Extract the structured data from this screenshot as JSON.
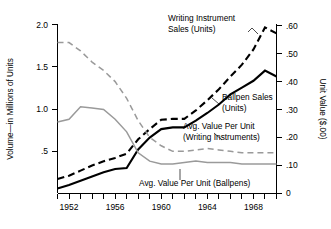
{
  "chart_data": {
    "type": "line",
    "title": "",
    "xlabel": "",
    "ylabel": "Volume—in Millions of Units",
    "y2label": "Unit Value ($.00)",
    "xlim": [
      1951,
      1970
    ],
    "ylim": [
      0,
      2.0
    ],
    "y2lim": [
      0,
      0.6
    ],
    "grid": false,
    "legend_position": "inline-annotations",
    "x_ticks": [
      1951,
      1952,
      1953,
      1954,
      1955,
      1956,
      1957,
      1958,
      1959,
      1960,
      1961,
      1962,
      1963,
      1964,
      1965,
      1966,
      1967,
      1968,
      1969,
      1970
    ],
    "x_tick_labels": [
      "1952",
      "1956",
      "1960",
      "1964",
      "1968"
    ],
    "x_tick_label_values": [
      1952,
      1956,
      1960,
      1964,
      1968
    ],
    "y_ticks": [
      0.5,
      1.0,
      1.5,
      2.0
    ],
    "y_tick_labels": [
      ".5",
      "1.0",
      "1.5",
      "2.0"
    ],
    "y2_ticks": [
      0,
      0.1,
      0.2,
      0.3,
      0.4,
      0.5,
      0.6
    ],
    "y2_tick_labels": [
      "0",
      ".10",
      ".20",
      ".30",
      ".40",
      ".50",
      ".60"
    ],
    "x": [
      1951,
      1952,
      1953,
      1954,
      1955,
      1956,
      1957,
      1958,
      1959,
      1960,
      1961,
      1962,
      1963,
      1964,
      1965,
      1966,
      1967,
      1968,
      1969,
      1970
    ],
    "series": [
      {
        "name": "Writing Instrument Sales (Units)",
        "axis": "left",
        "style": "dashed",
        "color": "#000000",
        "values": [
          0.17,
          0.21,
          0.27,
          0.33,
          0.38,
          0.42,
          0.47,
          0.64,
          0.76,
          0.87,
          0.88,
          0.88,
          0.98,
          1.1,
          1.23,
          1.38,
          1.52,
          1.7,
          1.96,
          1.89
        ]
      },
      {
        "name": "Ballpen Sales (Units)",
        "axis": "left",
        "style": "solid",
        "color": "#000000",
        "values": [
          0.06,
          0.1,
          0.15,
          0.2,
          0.25,
          0.29,
          0.3,
          0.52,
          0.66,
          0.76,
          0.78,
          0.78,
          0.86,
          0.95,
          1.05,
          1.17,
          1.25,
          1.33,
          1.45,
          1.38
        ]
      },
      {
        "name": "Avg. Value Per Unit (Writing Instruments)",
        "axis": "right",
        "style": "dashed",
        "color": "#9a9a9a",
        "values": [
          0.54,
          0.54,
          0.51,
          0.47,
          0.44,
          0.4,
          0.34,
          0.26,
          0.2,
          0.17,
          0.15,
          0.15,
          0.155,
          0.16,
          0.155,
          0.15,
          0.145,
          0.145,
          0.145,
          0.145
        ]
      },
      {
        "name": "Avg. Value Per Unit (Ballpens)",
        "axis": "right",
        "style": "solid",
        "color": "#9a9a9a",
        "values": [
          0.255,
          0.265,
          0.31,
          0.305,
          0.3,
          0.265,
          0.22,
          0.145,
          0.115,
          0.105,
          0.105,
          0.11,
          0.115,
          0.11,
          0.11,
          0.11,
          0.105,
          0.105,
          0.105,
          0.105
        ]
      }
    ],
    "annotations": [
      {
        "id": "writing-instrument-sales",
        "lines": [
          "Writing Instrument",
          "Sales (Units)"
        ],
        "x": 170,
        "y": 24
      },
      {
        "id": "ballpen-sales",
        "lines": [
          "Ballpen Sales",
          "(Units)",
          ""
        ],
        "x": 221,
        "y": 99
      },
      {
        "id": "avg-value-writing-instruments",
        "lines": [
          "Avg. Value Per Unit",
          "(Writing Instruments)"
        ],
        "x": 181,
        "y": 128
      },
      {
        "id": "avg-value-ballpens",
        "lines": [
          "Avg. Value Per Unit (Ballpens)"
        ],
        "x": 139,
        "y": 186
      }
    ]
  },
  "labels": {
    "y_axis_title": "Volume—in Millions of Units",
    "y2_axis_title": "Unit Value ($.00)",
    "ann_writing_line1": "Writing Instrument",
    "ann_writing_line2": "Sales (Units)",
    "ann_ballpen_line1": "Ballpen Sales",
    "ann_ballpen_line2": "(Units)",
    "ann_avgwi_line1": "Avg. Value Per Unit",
    "ann_avgwi_line2": "(Writing Instruments)",
    "ann_avgbp_line1": "Avg. Value Per Unit (Ballpens)",
    "ytick_2_0": "2.0",
    "ytick_1_5": "1.5",
    "ytick_1_0": "1.0",
    "ytick_0_5": ".5",
    "y2tick_60": ".60",
    "y2tick_50": ".50",
    "y2tick_40": ".40",
    "y2tick_30": ".30",
    "y2tick_20": ".20",
    "y2tick_10": ".10",
    "y2tick_0": "0",
    "xtick_1952": "1952",
    "xtick_1956": "1956",
    "xtick_1960": "1960",
    "xtick_1964": "1964",
    "xtick_1968": "1968"
  },
  "colors": {
    "axis": "#000000",
    "black_series": "#000000",
    "gray_series": "#9a9a9a",
    "background": "#ffffff"
  }
}
